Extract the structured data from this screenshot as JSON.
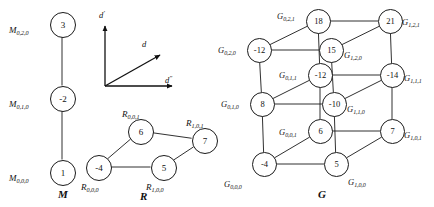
{
  "diagram": {
    "caption_m": "M",
    "caption_r": "R",
    "caption_g": "G",
    "axes": {
      "vertical": "d'",
      "diagonal": "d",
      "horizontal": "d″",
      "vertical_base": "d",
      "vertical_prime": "'",
      "diagonal_base": "d",
      "diagonal_prime": "",
      "horizontal_base": "d",
      "horizontal_prime": "″"
    },
    "graph_m": {
      "name": "M",
      "nodes": [
        {
          "id": "m020",
          "value": "3",
          "label_base": "M",
          "label_sub": "0,2,0",
          "x": 62,
          "y": 24
        },
        {
          "id": "m010",
          "value": "-2",
          "label_base": "M",
          "label_sub": "0,1,0",
          "x": 62,
          "y": 98
        },
        {
          "id": "m000",
          "value": "1",
          "label_base": "M",
          "label_sub": "0,0,0",
          "x": 62,
          "y": 172
        }
      ],
      "edges": [
        [
          "m020",
          "m010"
        ],
        [
          "m010",
          "m000"
        ]
      ]
    },
    "graph_r": {
      "name": "R",
      "nodes": [
        {
          "id": "r001",
          "value": "6",
          "label_base": "R",
          "label_sub": "0,0,1",
          "x": 140,
          "y": 131
        },
        {
          "id": "r101",
          "value": "7",
          "label_base": "R",
          "label_sub": "1,0,1",
          "x": 204,
          "y": 140
        },
        {
          "id": "r000",
          "value": "-4",
          "label_base": "R",
          "label_sub": "0,0,0",
          "x": 98,
          "y": 167
        },
        {
          "id": "r100",
          "value": "5",
          "label_base": "R",
          "label_sub": "1,0,0",
          "x": 163,
          "y": 167
        }
      ],
      "edges": [
        [
          "r001",
          "r101"
        ],
        [
          "r001",
          "r000"
        ],
        [
          "r000",
          "r100"
        ],
        [
          "r100",
          "r101"
        ]
      ]
    },
    "graph_g": {
      "name": "G",
      "nodes": [
        {
          "id": "g021",
          "value": "18",
          "label_base": "G",
          "label_sub": "0,2,1",
          "x": 318,
          "y": 21
        },
        {
          "id": "g121",
          "value": "21",
          "label_base": "G",
          "label_sub": "1,2,1",
          "x": 390,
          "y": 21
        },
        {
          "id": "g020",
          "value": "-12",
          "label_base": "G",
          "label_sub": "0,2,0",
          "x": 259,
          "y": 50
        },
        {
          "id": "g120",
          "value": "15",
          "label_base": "G",
          "label_sub": "1,2,0",
          "x": 331,
          "y": 50
        },
        {
          "id": "g011",
          "value": "-12",
          "label_base": "G",
          "label_sub": "0,1,1",
          "x": 320,
          "y": 75
        },
        {
          "id": "g111",
          "value": "-14",
          "label_base": "G",
          "label_sub": "1,1,1",
          "x": 392,
          "y": 75
        },
        {
          "id": "g010",
          "value": "8",
          "label_base": "G",
          "label_sub": "0,1,0",
          "x": 262,
          "y": 104
        },
        {
          "id": "g110",
          "value": "-10",
          "label_base": "G",
          "label_sub": "1,1,0",
          "x": 334,
          "y": 104
        },
        {
          "id": "g001",
          "value": "6",
          "label_base": "G",
          "label_sub": "0,0,1",
          "x": 320,
          "y": 131
        },
        {
          "id": "g101",
          "value": "7",
          "label_base": "G",
          "label_sub": "1,0,1",
          "x": 392,
          "y": 131
        },
        {
          "id": "g000",
          "value": "-4",
          "label_base": "G",
          "label_sub": "0,0,0",
          "x": 264,
          "y": 164
        },
        {
          "id": "g100",
          "value": "5",
          "label_base": "G",
          "label_sub": "1,0,0",
          "x": 336,
          "y": 164
        }
      ],
      "edges": [
        [
          "g021",
          "g121"
        ],
        [
          "g021",
          "g020"
        ],
        [
          "g021",
          "g011"
        ],
        [
          "g020",
          "g120"
        ],
        [
          "g120",
          "g121"
        ],
        [
          "g020",
          "g010"
        ],
        [
          "g011",
          "g111"
        ],
        [
          "g011",
          "g010"
        ],
        [
          "g011",
          "g001"
        ],
        [
          "g121",
          "g111"
        ],
        [
          "g111",
          "g101"
        ],
        [
          "g110",
          "g111"
        ],
        [
          "g010",
          "g110"
        ],
        [
          "g010",
          "g000"
        ],
        [
          "g001",
          "g101"
        ],
        [
          "g001",
          "g000"
        ],
        [
          "g000",
          "g100"
        ],
        [
          "g100",
          "g101"
        ],
        [
          "g100",
          "g110"
        ],
        [
          "g120",
          "g110"
        ]
      ]
    }
  }
}
